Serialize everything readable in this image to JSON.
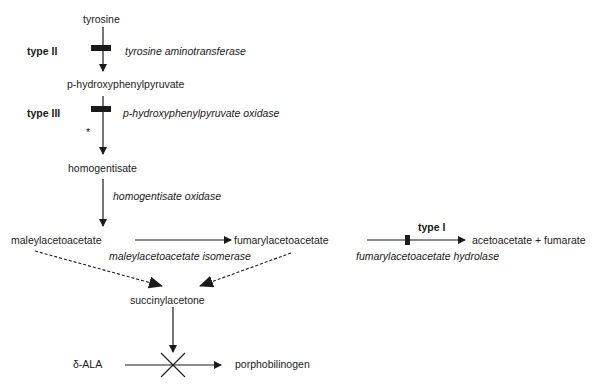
{
  "diagram": {
    "type": "metabolic-pathway",
    "compounds": {
      "tyrosine": "tyrosine",
      "hpp": "p-hydroxyphenylpyruvate",
      "homogentisate": "homogentisate",
      "maleylacetoacetate": "maleylacetoacetate",
      "fumarylacetoacetate": "fumarylacetoacetate",
      "products": "acetoacetate + fumarate",
      "succinylacetone": "succinylacetone",
      "ala": "δ-ALA",
      "porphobilinogen": "porphobilinogen"
    },
    "enzymes": {
      "tat": "tyrosine aminotransferase",
      "hppd": "p-hydroxyphenylpyruvate oxidase",
      "hgo": "homogentisate oxidase",
      "mai": "maleylacetoacetate isomerase",
      "fah": "fumarylacetoacetate hydrolase"
    },
    "blocks": {
      "type1": "type I",
      "type2": "type II",
      "type3": "type III"
    },
    "annotations": {
      "asterisk": "*"
    },
    "colors": {
      "line": "#1a1a1a",
      "background": "#ffffff"
    }
  }
}
